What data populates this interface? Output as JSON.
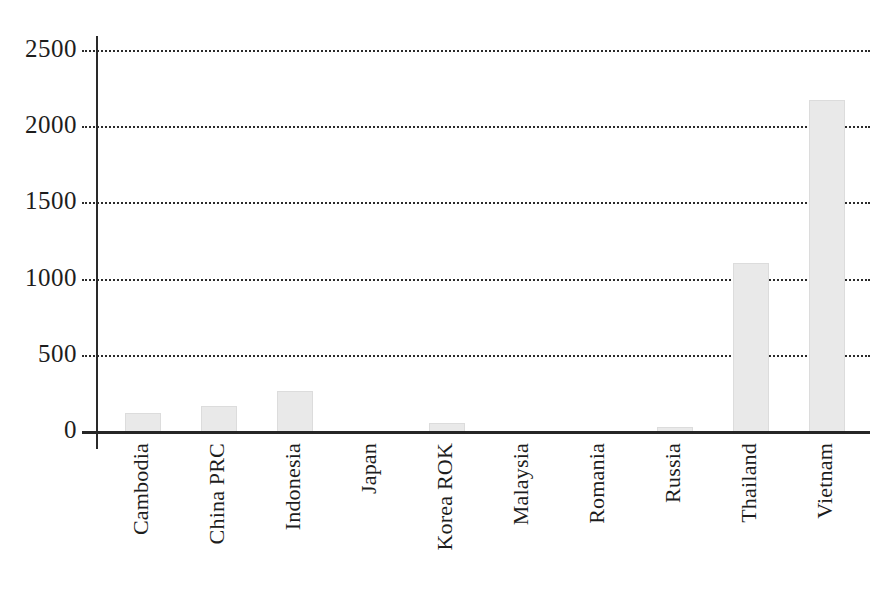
{
  "chart_data": {
    "type": "bar",
    "title": "",
    "xlabel": "",
    "ylabel": "",
    "categories": [
      "Cambodia",
      "China PRC",
      "Indonesia",
      "Japan",
      "Korea ROK",
      "Malaysia",
      "Romania",
      "Russia",
      "Thailand",
      "Vietnam"
    ],
    "values": [
      120,
      165,
      265,
      0,
      50,
      0,
      0,
      25,
      1100,
      2175
    ],
    "ylim": [
      0,
      2500
    ],
    "yticks": [
      0,
      500,
      1000,
      1500,
      2000,
      2500
    ],
    "ytick_labels": [
      "0",
      "500",
      "1000",
      "1500",
      "2000",
      "2500"
    ],
    "grid": true,
    "grid_style": "dotted",
    "legend": null,
    "bar_color": "#e9e9e9",
    "axis_color": "#262626",
    "grid_color": "#2b2b2b",
    "text_color": "#1d1d1d"
  },
  "figure": {
    "background": "#ffffff",
    "caption_fragment": ""
  }
}
